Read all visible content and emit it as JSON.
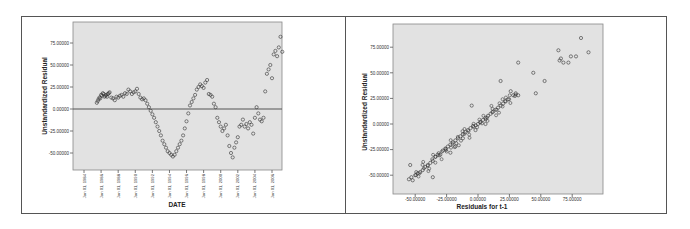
{
  "chart_data": [
    {
      "type": "scatter",
      "title": "",
      "xlabel": "DATE",
      "ylabel": "Unstandardized Residual",
      "ylim": [
        -60,
        85
      ],
      "yticks": [
        "75.00000",
        "50.00000",
        "25.00000",
        "0.00000",
        "-25.00000",
        "-50.00000"
      ],
      "xticks": [
        "Jan 01, 1984",
        "Jan 01, 1986",
        "Jan 01, 1988",
        "Jan 01, 1990",
        "Jan 01, 1992",
        "Jan 01, 1994",
        "Jan 01, 1996",
        "Jan 01, 1998",
        "Jan 01, 2000",
        "Jan 01, 2002",
        "Jan 01, 2004",
        "Jan 01, 2006"
      ],
      "reference_line": {
        "y": 0
      },
      "background": "#e0e0e0",
      "marker": "open-circle",
      "series": [
        {
          "name": "Unstandardized Residual",
          "points": [
            [
              1985.5,
              7
            ],
            [
              1985.6,
              9
            ],
            [
              1985.7,
              11
            ],
            [
              1985.8,
              13
            ],
            [
              1885.9,
              12
            ],
            [
              1986.0,
              16
            ],
            [
              1986.1,
              15
            ],
            [
              1986.2,
              18
            ],
            [
              1986.3,
              17
            ],
            [
              1986.4,
              14
            ],
            [
              1986.5,
              15
            ],
            [
              1986.6,
              16
            ],
            [
              1986.7,
              14
            ],
            [
              1986.8,
              17
            ],
            [
              1986.9,
              18
            ],
            [
              1987.0,
              19
            ],
            [
              1987.2,
              13
            ],
            [
              1987.4,
              12
            ],
            [
              1987.6,
              10
            ],
            [
              1987.8,
              14
            ],
            [
              1988.0,
              13
            ],
            [
              1988.2,
              15
            ],
            [
              1988.4,
              16
            ],
            [
              1988.6,
              14
            ],
            [
              1988.8,
              18
            ],
            [
              1989.0,
              17
            ],
            [
              1989.2,
              22
            ],
            [
              1989.4,
              20
            ],
            [
              1989.6,
              17
            ],
            [
              1989.8,
              19
            ],
            [
              1990.0,
              20
            ],
            [
              1990.2,
              23
            ],
            [
              1990.4,
              17
            ],
            [
              1990.6,
              13
            ],
            [
              1990.8,
              11
            ],
            [
              1991.0,
              12
            ],
            [
              1991.2,
              10
            ],
            [
              1991.4,
              6
            ],
            [
              1991.6,
              2
            ],
            [
              1991.8,
              -2
            ],
            [
              1992.0,
              -6
            ],
            [
              1992.2,
              -10
            ],
            [
              1992.4,
              -15
            ],
            [
              1992.6,
              -20
            ],
            [
              1992.8,
              -25
            ],
            [
              1993.0,
              -30
            ],
            [
              1993.2,
              -36
            ],
            [
              1993.4,
              -40
            ],
            [
              1993.6,
              -44
            ],
            [
              1993.8,
              -48
            ],
            [
              1994.0,
              -50
            ],
            [
              1994.2,
              -52
            ],
            [
              1994.4,
              -54
            ],
            [
              1994.6,
              -52
            ],
            [
              1994.8,
              -48
            ],
            [
              1995.0,
              -44
            ],
            [
              1995.2,
              -40
            ],
            [
              1995.4,
              -36
            ],
            [
              1995.6,
              -30
            ],
            [
              1995.8,
              -22
            ],
            [
              1996.0,
              -14
            ],
            [
              1996.2,
              -5
            ],
            [
              1996.4,
              4
            ],
            [
              1996.6,
              8
            ],
            [
              1996.8,
              12
            ],
            [
              1997.0,
              16
            ],
            [
              1997.2,
              22
            ],
            [
              1997.4,
              25
            ],
            [
              1997.6,
              28
            ],
            [
              1997.8,
              26
            ],
            [
              1998.0,
              24
            ],
            [
              1998.2,
              30
            ],
            [
              1998.4,
              33
            ],
            [
              1998.6,
              17
            ],
            [
              1998.8,
              16
            ],
            [
              1999.0,
              14
            ],
            [
              1999.2,
              6
            ],
            [
              1999.4,
              2
            ],
            [
              1999.6,
              -10
            ],
            [
              1999.8,
              -15
            ],
            [
              2000.0,
              -20
            ],
            [
              2000.2,
              -25
            ],
            [
              2000.4,
              -22
            ],
            [
              2000.6,
              -18
            ],
            [
              2000.8,
              -30
            ],
            [
              2001.0,
              -42
            ],
            [
              2001.2,
              -50
            ],
            [
              2001.4,
              -55
            ],
            [
              2001.6,
              -44
            ],
            [
              2001.8,
              -38
            ],
            [
              2002.0,
              -32
            ],
            [
              2002.2,
              -20
            ],
            [
              2002.4,
              -18
            ],
            [
              2002.6,
              -12
            ],
            [
              2002.8,
              -20
            ],
            [
              2003.0,
              -17
            ],
            [
              2003.2,
              -22
            ],
            [
              2003.4,
              -15
            ],
            [
              2003.6,
              -18
            ],
            [
              2003.8,
              -28
            ],
            [
              2004.0,
              -10
            ],
            [
              2004.2,
              2
            ],
            [
              2004.4,
              -5
            ],
            [
              2004.6,
              -12
            ],
            [
              2004.8,
              -14
            ],
            [
              2005.0,
              -10
            ],
            [
              2005.2,
              20
            ],
            [
              2005.4,
              40
            ],
            [
              2005.6,
              45
            ],
            [
              2005.8,
              50
            ],
            [
              2006.0,
              35
            ],
            [
              2006.2,
              62
            ],
            [
              2006.4,
              66
            ],
            [
              2006.6,
              60
            ],
            [
              2006.8,
              70
            ],
            [
              2007.0,
              82
            ],
            [
              2007.2,
              65
            ]
          ]
        }
      ]
    },
    {
      "type": "scatter",
      "title": "",
      "xlabel": "Residuals for t-1",
      "ylabel": "Unstandardized Residual",
      "xlim": [
        -60,
        90
      ],
      "ylim": [
        -60,
        85
      ],
      "xticks": [
        "-50.00000",
        "-25.00000",
        "0.00000",
        "25.00000",
        "50.00000",
        "75.00000"
      ],
      "yticks": [
        "75.00000",
        "50.00000",
        "25.00000",
        "0.00000",
        "-25.00000",
        "-50.00000"
      ],
      "background": "#e0e0e0",
      "marker": "open-circle",
      "series": [
        {
          "name": "Residual vs lagged residual",
          "points": [
            [
              -55,
              -54
            ],
            [
              -53,
              -52
            ],
            [
              -52,
              -55
            ],
            [
              -50,
              -50
            ],
            [
              -48,
              -48
            ],
            [
              -46,
              -47
            ],
            [
              -44,
              -45
            ],
            [
              -42,
              -42
            ],
            [
              -54,
              -40
            ],
            [
              -40,
              -40
            ],
            [
              -38,
              -38
            ],
            [
              -36,
              -36
            ],
            [
              -34,
              -32
            ],
            [
              -32,
              -30
            ],
            [
              -36,
              -52
            ],
            [
              -30,
              -30
            ],
            [
              -28,
              -26
            ],
            [
              -26,
              -24
            ],
            [
              -24,
              -22
            ],
            [
              -22,
              -20
            ],
            [
              -20,
              -18
            ],
            [
              -18,
              -16
            ],
            [
              -16,
              -14
            ],
            [
              -14,
              -12
            ],
            [
              -12,
              -10
            ],
            [
              -10,
              -8
            ],
            [
              -22,
              -28
            ],
            [
              -18,
              -22
            ],
            [
              -12,
              -14
            ],
            [
              -8,
              -6
            ],
            [
              -6,
              -4
            ],
            [
              -4,
              -2
            ],
            [
              -2,
              -6
            ],
            [
              0,
              0
            ],
            [
              2,
              2
            ],
            [
              4,
              4
            ],
            [
              6,
              6
            ],
            [
              -5,
              18
            ],
            [
              8,
              8
            ],
            [
              10,
              10
            ],
            [
              12,
              12
            ],
            [
              14,
              14
            ],
            [
              16,
              16
            ],
            [
              18,
              18
            ],
            [
              20,
              20
            ],
            [
              22,
              22
            ],
            [
              24,
              24
            ],
            [
              6,
              0
            ],
            [
              28,
              28
            ],
            [
              30,
              30
            ],
            [
              32,
              28
            ],
            [
              26,
              32
            ],
            [
              32,
              60
            ],
            [
              18,
              42
            ],
            [
              44,
              50
            ],
            [
              46,
              30
            ],
            [
              53,
              42
            ],
            [
              64,
              72
            ],
            [
              66,
              64
            ],
            [
              68,
              60
            ],
            [
              72,
              60
            ],
            [
              74,
              66
            ],
            [
              78,
              66
            ],
            [
              82,
              84
            ],
            [
              88,
              70
            ],
            [
              65,
              62
            ]
          ]
        }
      ]
    }
  ],
  "left_chart": {
    "ylabel": "Unstandardized Residual",
    "xlabel": "DATE",
    "yticks": [
      "75.00000",
      "50.00000",
      "25.00000",
      "0.00000",
      "-25.00000",
      "-50.00000"
    ],
    "xticks": [
      "Jan 01, 1984",
      "Jan 01, 1986",
      "Jan 01, 1988",
      "Jan 01, 1990",
      "Jan 01, 1992",
      "Jan 01, 1994",
      "Jan 01, 1996",
      "Jan 01, 1998",
      "Jan 01, 2000",
      "Jan 01, 2002",
      "Jan 01, 2004",
      "Jan 01, 2006"
    ]
  },
  "right_chart": {
    "ylabel": "Unstandardized Residual",
    "xlabel": "Residuals for t-1",
    "yticks": [
      "75.00000",
      "50.00000",
      "25.00000",
      "0.00000",
      "-25.00000",
      "-50.00000"
    ],
    "xticks": [
      "-50.00000",
      "-25.00000",
      "0.00000",
      "25.00000",
      "50.00000",
      "75.00000"
    ]
  },
  "colors": {
    "plot_bg": "#e2e2e2",
    "frame": "#555555",
    "marker": "#333333",
    "ref_line": "#555555"
  }
}
